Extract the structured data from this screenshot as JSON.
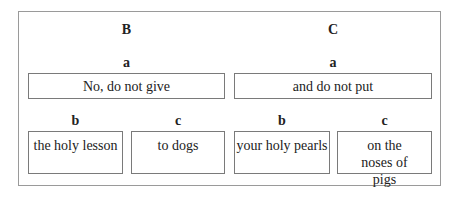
{
  "diagram": {
    "columns": [
      {
        "label": "B",
        "a": {
          "label": "a",
          "text": "No, do not give"
        },
        "b": {
          "label": "b",
          "text": "the holy lesson"
        },
        "c": {
          "label": "c",
          "text": "to dogs"
        }
      },
      {
        "label": "C",
        "a": {
          "label": "a",
          "text": "and do not put"
        },
        "b": {
          "label": "b",
          "text": "your holy pearls"
        },
        "c": {
          "label": "c",
          "text": "on the noses of pigs"
        }
      }
    ]
  }
}
